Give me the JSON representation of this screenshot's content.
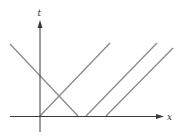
{
  "diagram": {
    "type": "spacetime-diagram",
    "axes": {
      "vertical_label": "t",
      "horizontal_label": "x",
      "color": "#3a3a3a"
    },
    "lines": [
      {
        "name": "descending-line",
        "from": [
          10,
          44
        ],
        "to": [
          78,
          116
        ]
      },
      {
        "name": "ascending-line-1",
        "from": [
          40,
          116
        ],
        "to": [
          110,
          43
        ]
      },
      {
        "name": "ascending-line-2",
        "from": [
          86,
          116
        ],
        "to": [
          157,
          43
        ]
      },
      {
        "name": "ascending-line-3",
        "from": [
          106,
          116
        ],
        "to": [
          173,
          48
        ]
      }
    ],
    "line_color": "#8a8a8a"
  }
}
